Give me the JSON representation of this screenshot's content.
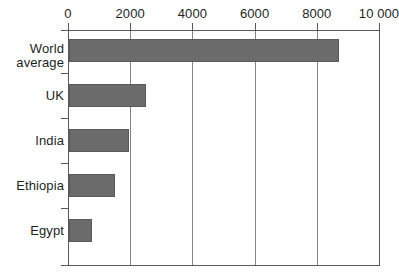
{
  "chart_data": {
    "type": "bar",
    "orientation": "horizontal",
    "title": "",
    "subtitle": "",
    "xlabel": "",
    "ylabel": "",
    "categories": [
      "World average",
      "UK",
      "India",
      "Ethiopia",
      "Egypt"
    ],
    "values": [
      8700,
      2500,
      1950,
      1500,
      780
    ],
    "series": [
      {
        "name": "",
        "values": [
          8700,
          2500,
          1950,
          1500,
          780
        ]
      }
    ],
    "xlim": [
      0,
      10000
    ],
    "xticks": [
      0,
      2000,
      4000,
      6000,
      8000,
      10000
    ],
    "xtick_labels": [
      "0",
      "2000",
      "4000",
      "6000",
      "8000",
      "10 000"
    ],
    "grid": "vertical",
    "legend": "none",
    "bar_color": "#6b6b6b",
    "axis_color": "#58595b",
    "grid_color": "#808285",
    "text_color": "#231f20",
    "background": "#ffffff"
  },
  "axis": {
    "x_ticks": [
      {
        "label": "0",
        "value": 0
      },
      {
        "label": "2000",
        "value": 2000
      },
      {
        "label": "4000",
        "value": 4000
      },
      {
        "label": "6000",
        "value": 6000
      },
      {
        "label": "8000",
        "value": 8000
      },
      {
        "label": "10 000",
        "value": 10000
      }
    ]
  },
  "bars": [
    {
      "label": "World\naverage",
      "value": 8700
    },
    {
      "label": "UK",
      "value": 2500
    },
    {
      "label": "India",
      "value": 1950
    },
    {
      "label": "Ethiopia",
      "value": 1500
    },
    {
      "label": "Egypt",
      "value": 780
    }
  ]
}
